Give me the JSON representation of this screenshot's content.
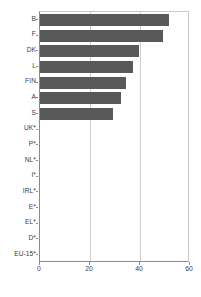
{
  "chart_data": {
    "type": "bar",
    "orientation": "horizontal",
    "title": "",
    "subtitle": "",
    "xlabel": "",
    "ylabel": "",
    "categories": [
      "B",
      "F",
      "DK",
      "L",
      "FIN",
      "A",
      "S",
      "UK*",
      "P*",
      "NL*",
      "I*",
      "IRL*",
      "E*",
      "EL*",
      "D*",
      "EU-15*"
    ],
    "values": [
      51.5,
      49.0,
      39.5,
      37.0,
      34.5,
      32.5,
      29.0,
      0,
      0,
      0,
      0,
      0,
      0,
      0,
      0,
      0
    ],
    "series": [
      {
        "name": "",
        "values": [
          51.5,
          49.0,
          39.5,
          37.0,
          34.5,
          32.5,
          29.0,
          0,
          0,
          0,
          0,
          0,
          0,
          0,
          0,
          0
        ]
      }
    ],
    "xlim": [
      0,
      60
    ],
    "xticks": [
      0,
      20,
      40,
      60
    ],
    "xtick_labels": [
      "0",
      "20",
      "40",
      "60"
    ],
    "grid": "vertical",
    "legend": "none",
    "bar_color": "#595959",
    "gridline_color": "#cfcfcf",
    "axis_color": "#8a8a8a"
  },
  "axis": {
    "x_tick_labels": [
      "0",
      "20",
      "40",
      "60"
    ],
    "y_tick_labels": [
      "B",
      "F",
      "DK",
      "L",
      "FIN",
      "A",
      "S",
      "UK*",
      "P*",
      "NL*",
      "I*",
      "IRL*",
      "E*",
      "EL*",
      "D*",
      "EU-15*"
    ]
  }
}
